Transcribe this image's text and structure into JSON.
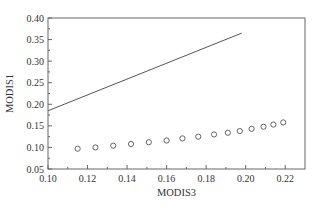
{
  "chart_data": {
    "type": "scatter",
    "title": "",
    "xlabel": "MODIS3",
    "ylabel": "MODIS1",
    "xlim": [
      0.1,
      0.23
    ],
    "ylim": [
      0.05,
      0.4
    ],
    "xticks": [
      0.1,
      0.12,
      0.14,
      0.16,
      0.18,
      0.2,
      0.22
    ],
    "xtick_labels": [
      "0.10",
      "0.12",
      "0.14",
      "0.16",
      "0.18",
      "0.20",
      "0.22"
    ],
    "yticks": [
      0.05,
      0.1,
      0.15,
      0.2,
      0.25,
      0.3,
      0.35,
      0.4
    ],
    "ytick_labels": [
      "0.05",
      "0.10",
      "0.15",
      "0.20",
      "0.25",
      "0.30",
      "0.35",
      "0.40"
    ],
    "grid": false,
    "legend": null,
    "series": [
      {
        "name": "line",
        "type": "line",
        "color": "#555555",
        "x": [
          0.1,
          0.198
        ],
        "y": [
          0.185,
          0.365
        ]
      },
      {
        "name": "points",
        "type": "scatter",
        "marker": "open-circle",
        "color": "#555555",
        "x": [
          0.115,
          0.124,
          0.133,
          0.142,
          0.151,
          0.16,
          0.168,
          0.176,
          0.184,
          0.191,
          0.197,
          0.203,
          0.209,
          0.214,
          0.219
        ],
        "y": [
          0.097,
          0.1,
          0.104,
          0.108,
          0.112,
          0.116,
          0.121,
          0.125,
          0.13,
          0.134,
          0.138,
          0.143,
          0.148,
          0.153,
          0.158
        ]
      }
    ]
  },
  "plot_area": {
    "left": 48,
    "top": 18,
    "right": 305,
    "bottom": 169
  }
}
